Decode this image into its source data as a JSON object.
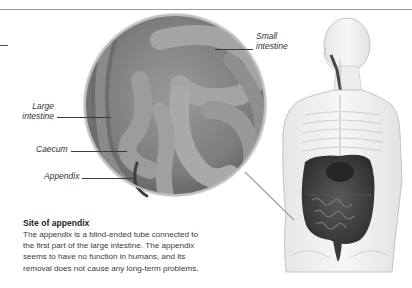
{
  "labels": {
    "small_intestine": [
      "Small",
      "intestine"
    ],
    "large_intestine": [
      "Large",
      "intestine"
    ],
    "caecum": "Caecum",
    "appendix": "Appendix"
  },
  "caption": {
    "title": "Site of appendix",
    "lines": [
      "The appendix is a blind-ended tube connected to",
      "the first part of the large intestine. The appendix",
      "seems to have no function in humans, and its",
      "removal does not cause any long-term problems."
    ]
  },
  "illustration": {
    "magnified_view": "intestines-close-up",
    "body_figure": "translucent-torso-digestive-system"
  }
}
